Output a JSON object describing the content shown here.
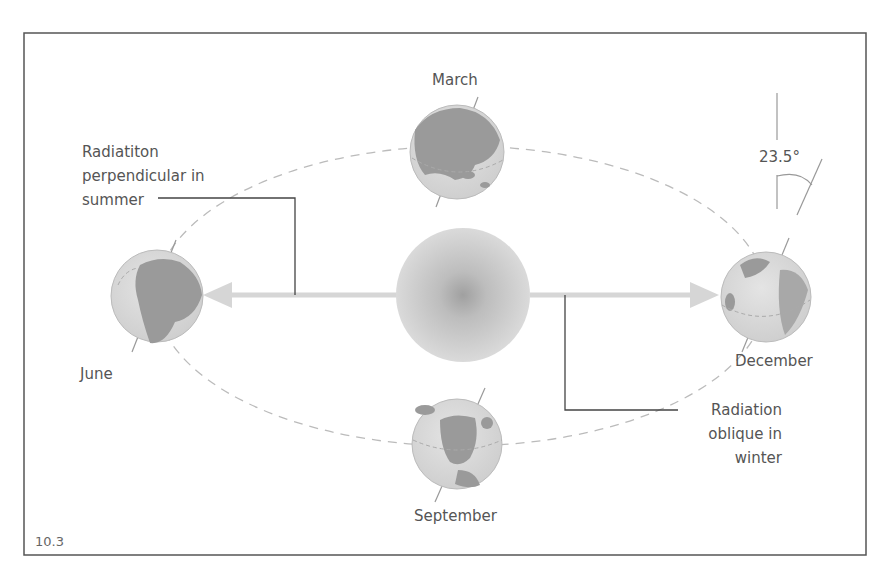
{
  "figure": {
    "number": "10.3",
    "frame_color": "#555555",
    "orbit_color": "#bbbbbb",
    "arrow_color": "#d6d6d6",
    "globe_ocean": "#dcdcdc",
    "globe_land": "#9a9a9a",
    "sun_edge": "#d8d8d8",
    "sun_core": "#9c9c9c"
  },
  "positions": {
    "march": {
      "label": "March"
    },
    "june": {
      "label": "June"
    },
    "september": {
      "label": "September"
    },
    "december": {
      "label": "December"
    }
  },
  "annotations": {
    "summer": {
      "lines": [
        "Radiatiton",
        "perpendicular in",
        "summer"
      ]
    },
    "winter": {
      "lines": [
        "Radiation",
        "oblique in",
        "winter"
      ]
    },
    "tilt": {
      "label": "23.5°"
    }
  }
}
